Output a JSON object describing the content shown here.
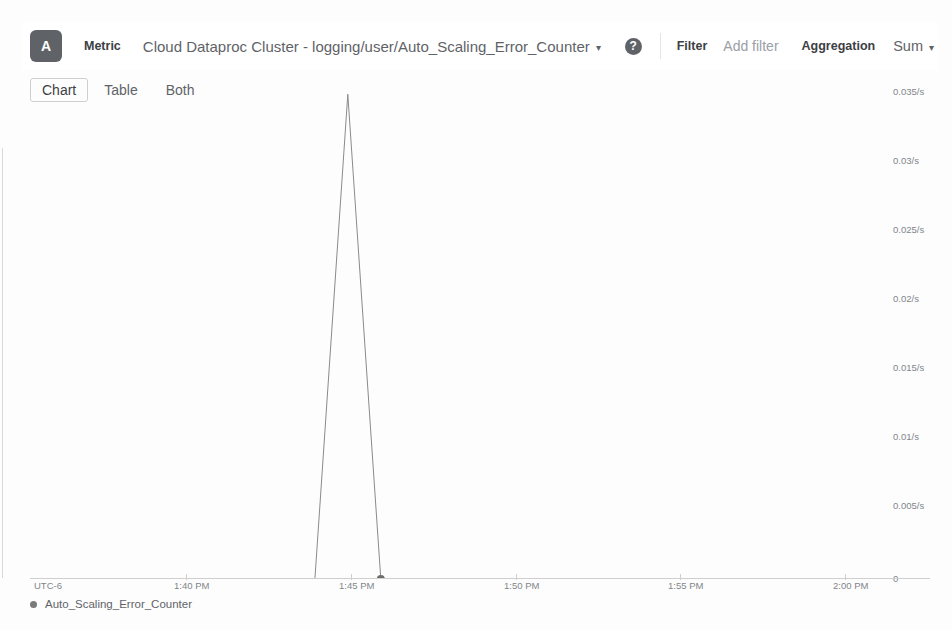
{
  "header": {
    "series_badge": "A",
    "metric_label": "Metric",
    "metric_value": "Cloud Dataproc Cluster - logging/user/Auto_Scaling_Error_Counter",
    "metric_caret": "▾",
    "help_icon_glyph": "?",
    "filter_label": "Filter",
    "filter_placeholder": "Add filter",
    "aggregation_label": "Aggregation",
    "aggregation_value": "Sum",
    "aggregation_caret": "▾"
  },
  "view_tabs": [
    {
      "label": "Chart",
      "selected": true
    },
    {
      "label": "Table",
      "selected": false
    },
    {
      "label": "Both",
      "selected": false
    }
  ],
  "chart_data": {
    "type": "line",
    "title": "",
    "xlabel": "",
    "ylabel": "",
    "timezone_label": "UTC-6",
    "grid": false,
    "legend_position": "bottom-left",
    "series": [
      {
        "name": "Auto_Scaling_Error_Counter",
        "color": "#8a8a8a",
        "x": [
          "1:36 PM",
          "1:43 PM",
          "1:44 PM",
          "1:45 PM",
          "1:46 PM",
          "2:01 PM"
        ],
        "values": [
          0,
          0,
          0.0365,
          0,
          0,
          0
        ]
      }
    ],
    "x_ticks": [
      "1:40 PM",
      "1:45 PM",
      "1:50 PM",
      "1:55 PM",
      "2:00 PM"
    ],
    "y_ticks": [
      "0.035/s",
      "0.03/s",
      "0.025/s",
      "0.02/s",
      "0.015/s",
      "0.01/s",
      "0.005/s",
      "0"
    ],
    "ylim": [
      0,
      0.0375
    ],
    "peak": {
      "time": "1:44 PM",
      "value": 0.0365,
      "label": "0.0365/s"
    },
    "marker_point": {
      "time": "1:45 PM",
      "value": 0
    }
  },
  "legend": [
    {
      "label": "Auto_Scaling_Error_Counter",
      "color": "#7a7a7a"
    }
  ]
}
